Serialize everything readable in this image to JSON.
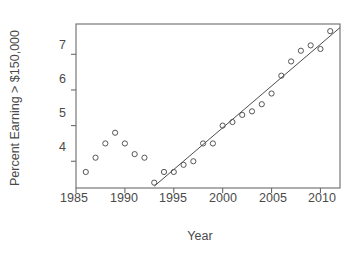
{
  "chart_data": {
    "type": "scatter",
    "title": "",
    "xlabel": "Year",
    "ylabel": "Percent Earning > $150,000",
    "xlim": [
      1985.0,
      2012.0
    ],
    "ylim": [
      3.25,
      7.85
    ],
    "xticks": [
      1985,
      1990,
      1995,
      2000,
      2005,
      2010
    ],
    "xtick_labels": [
      "1985",
      "1990",
      "1995",
      "2000",
      "2005",
      "2010"
    ],
    "yticks": [
      4,
      5,
      6,
      7
    ],
    "ytick_labels": [
      "4",
      "5",
      "6",
      "7"
    ],
    "grid": false,
    "legend": null,
    "marker": "open-circle",
    "x": [
      1986,
      1987,
      1988,
      1989,
      1990,
      1991,
      1992,
      1993,
      1994,
      1995,
      1996,
      1997,
      1998,
      1999,
      2000,
      2001,
      2002,
      2003,
      2004,
      2005,
      2006,
      2007,
      2008,
      2009,
      2010,
      2011
    ],
    "y": [
      3.7,
      4.1,
      4.5,
      4.8,
      4.5,
      4.2,
      4.1,
      3.4,
      3.7,
      3.7,
      3.9,
      4.0,
      4.5,
      4.5,
      5.0,
      5.1,
      5.3,
      5.4,
      5.6,
      5.9,
      6.4,
      6.8,
      7.1,
      7.25,
      7.15,
      7.65
    ],
    "series": [
      {
        "name": "Percent Earning > $150,000",
        "values": [
          3.7,
          4.1,
          4.5,
          4.8,
          4.5,
          4.2,
          4.1,
          3.4,
          3.7,
          3.7,
          3.9,
          4.0,
          4.5,
          4.5,
          5.0,
          5.1,
          5.3,
          5.4,
          5.6,
          5.9,
          6.4,
          6.8,
          7.1,
          7.25,
          7.15,
          7.65
        ]
      }
    ],
    "fit_line": {
      "type": "linear-regression",
      "description": "straight trend line fitted over 1993-2012 portion",
      "x_start": 1993.0,
      "y_start": 3.3,
      "x_end": 2012.0,
      "y_end": 7.75
    },
    "colors": {
      "marker_stroke": "#555555",
      "line": "#4d4d4d",
      "axis": "#6b6b6b",
      "text": "#4a4a4a",
      "background": "#ffffff"
    }
  }
}
